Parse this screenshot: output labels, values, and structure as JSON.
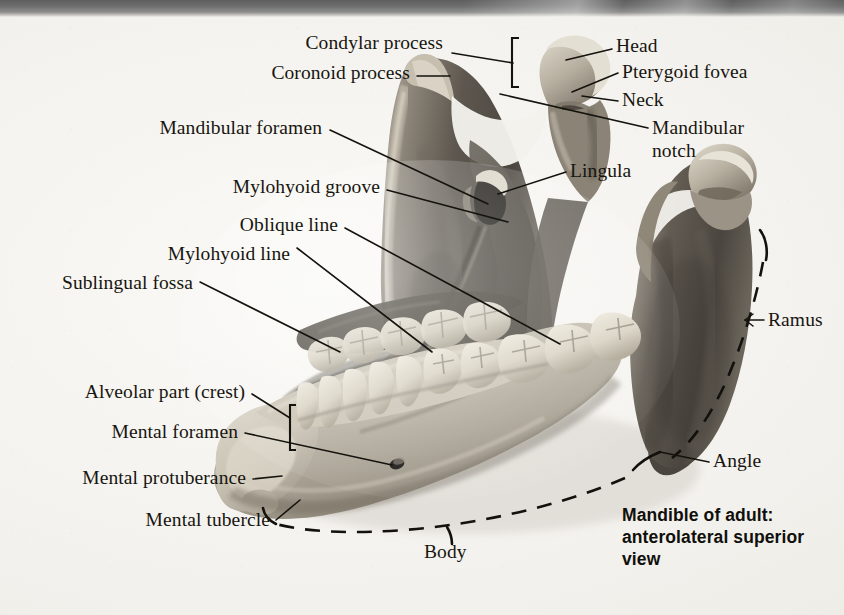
{
  "figure": {
    "title": "Mandible of adult:",
    "subtitle": "anterolateral superior",
    "subtitle2": "view",
    "caption_full": "Mandible of adult: anterolateral superior view",
    "medium": "grayscale photographic plate of a dry adult human mandible"
  },
  "labels": {
    "condylar_process": "Condylar process",
    "coronoid_process": "Coronoid process",
    "mandibular_foramen": "Mandibular foramen",
    "mylohyoid_groove": "Mylohyoid groove",
    "oblique_line": "Oblique line",
    "mylohyoid_line": "Mylohyoid line",
    "sublingual_fossa": "Sublingual fossa",
    "alveolar_part": "Alveolar part (crest)",
    "mental_foramen": "Mental foramen",
    "mental_protuberance": "Mental protuberance",
    "mental_tubercle": "Mental tubercle",
    "head": "Head",
    "pterygoid_fovea": "Pterygoid fovea",
    "neck": "Neck",
    "mandibular_notch_l1": "Mandibular",
    "mandibular_notch_l2": "notch",
    "lingula": "Lingula",
    "ramus": "Ramus",
    "angle": "Angle",
    "body": "Body"
  },
  "colors": {
    "page": "#f4f2ee",
    "ink": "#15130e",
    "page_edge_dark": "#5e5e5e",
    "bone_light": "#d8d2c6",
    "bone_mid": "#9d968a",
    "bone_dark": "#55504a",
    "tooth": "#e6e1d4"
  }
}
